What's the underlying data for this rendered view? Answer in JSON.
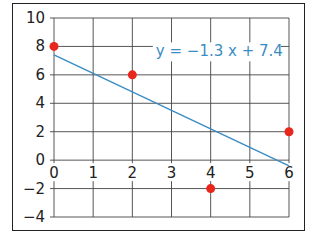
{
  "chart_data": {
    "type": "scatter",
    "title": "",
    "xlabel": "",
    "ylabel": "",
    "xlim": [
      0,
      6
    ],
    "ylim": [
      -4,
      10
    ],
    "grid": true,
    "x_ticks": [
      "0",
      "1",
      "2",
      "3",
      "4",
      "5",
      "6"
    ],
    "y_ticks": [
      "10",
      "8",
      "6",
      "4",
      "2",
      "0",
      "−2",
      "−4"
    ],
    "series": [
      {
        "name": "points",
        "type": "scatter",
        "color": "#e8261c",
        "points": [
          {
            "x": 0,
            "y": 8
          },
          {
            "x": 2,
            "y": 6
          },
          {
            "x": 4,
            "y": -2
          },
          {
            "x": 6,
            "y": 2
          }
        ]
      },
      {
        "name": "regression line",
        "type": "line",
        "color": "#3a8cc4",
        "slope": -1.3,
        "intercept": 7.4,
        "x_range": [
          0,
          6
        ]
      }
    ],
    "annotations": [
      {
        "text": "y = −1.3 x + 7.4",
        "x": 2.6,
        "y": 7.3,
        "color": "#3a8cc4"
      }
    ]
  }
}
